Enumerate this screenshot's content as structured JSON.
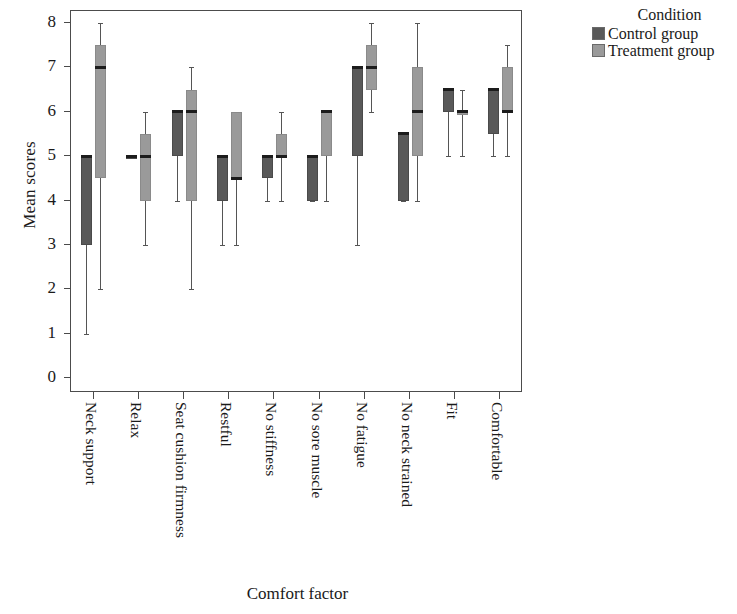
{
  "chart_data": {
    "type": "box",
    "title": "",
    "xlabel": "Comfort factor",
    "ylabel": "Mean scores",
    "ylim": [
      0,
      8
    ],
    "yticks": [
      8,
      7,
      6,
      5,
      4,
      3,
      2,
      1,
      0
    ],
    "grid": false,
    "legend": {
      "title": "Condition",
      "position": "right",
      "entries": [
        {
          "name": "Control group",
          "color": "#595959"
        },
        {
          "name": "Treatment group",
          "color": "#9a9a9a"
        }
      ]
    },
    "categories": [
      "Neck support",
      "Relax",
      "Seat cushion firmness",
      "Restful",
      "No stiffness",
      "No sore muscle",
      "No fatigue",
      "No neck strained",
      "Fit",
      "Comfortable"
    ],
    "series": [
      {
        "name": "Control group",
        "color": "#595959",
        "boxes": [
          {
            "category": "Neck support",
            "min": 1,
            "q1": 3,
            "median": 5,
            "q3": 5,
            "max": 5
          },
          {
            "category": "Relax",
            "min": 5,
            "q1": 5,
            "median": 5,
            "q3": 5,
            "max": 5
          },
          {
            "category": "Seat cushion firmness",
            "min": 4,
            "q1": 5,
            "median": 6,
            "q3": 6,
            "max": 6
          },
          {
            "category": "Restful",
            "min": 3,
            "q1": 4,
            "median": 5,
            "q3": 5,
            "max": 5
          },
          {
            "category": "No stiffness",
            "min": 4,
            "q1": 4.5,
            "median": 5,
            "q3": 5,
            "max": 5
          },
          {
            "category": "No sore muscle",
            "min": 4,
            "q1": 4,
            "median": 5,
            "q3": 5,
            "max": 5
          },
          {
            "category": "No fatigue",
            "min": 3,
            "q1": 5,
            "median": 7,
            "q3": 7,
            "max": 7
          },
          {
            "category": "No neck strained",
            "min": 4,
            "q1": 4,
            "median": 5.5,
            "q3": 5.5,
            "max": 5.5
          },
          {
            "category": "Fit",
            "min": 5,
            "q1": 6,
            "median": 6.5,
            "q3": 6.5,
            "max": 6.5
          },
          {
            "category": "Comfortable",
            "min": 5,
            "q1": 5.5,
            "median": 6.5,
            "q3": 6.5,
            "max": 6.5
          }
        ]
      },
      {
        "name": "Treatment group",
        "color": "#9a9a9a",
        "boxes": [
          {
            "category": "Neck support",
            "min": 2,
            "q1": 4.5,
            "median": 7,
            "q3": 7.5,
            "max": 8
          },
          {
            "category": "Relax",
            "min": 3,
            "q1": 4,
            "median": 5,
            "q3": 5.5,
            "max": 6
          },
          {
            "category": "Seat cushion firmness",
            "min": 2,
            "q1": 4,
            "median": 6,
            "q3": 6.5,
            "max": 7
          },
          {
            "category": "Restful",
            "min": 3,
            "q1": 4.5,
            "median": 4.5,
            "q3": 6,
            "max": 6
          },
          {
            "category": "No stiffness",
            "min": 4,
            "q1": 5,
            "median": 5,
            "q3": 5.5,
            "max": 6
          },
          {
            "category": "No sore muscle",
            "min": 4,
            "q1": 5,
            "median": 6,
            "q3": 6,
            "max": 6
          },
          {
            "category": "No fatigue",
            "min": 6,
            "q1": 6.5,
            "median": 7,
            "q3": 7.5,
            "max": 8
          },
          {
            "category": "No neck strained",
            "min": 4,
            "q1": 5,
            "median": 6,
            "q3": 7,
            "max": 8
          },
          {
            "category": "Fit",
            "min": 5,
            "q1": 6,
            "median": 6,
            "q3": 6,
            "max": 6.5
          },
          {
            "category": "Comfortable",
            "min": 5,
            "q1": 6,
            "median": 6,
            "q3": 7,
            "max": 7.5
          }
        ]
      }
    ]
  }
}
